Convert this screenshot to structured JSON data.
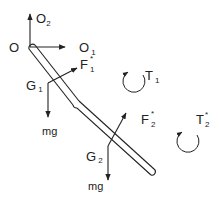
{
  "diagram": {
    "stroke_color": "#222222",
    "origin": {
      "label": "O"
    },
    "axes": [
      {
        "name": "O1",
        "base": "O",
        "sub": "1"
      },
      {
        "name": "O2",
        "base": "O",
        "sub": "2"
      }
    ],
    "links": [
      {
        "name": "link-1",
        "center_of_mass": {
          "base": "G",
          "sub": "1"
        }
      },
      {
        "name": "link-2",
        "center_of_mass": {
          "base": "G",
          "sub": "2"
        }
      }
    ],
    "forces": [
      {
        "name": "F1-star",
        "base": "F",
        "sup": "*",
        "sub": "1"
      },
      {
        "name": "F2-star",
        "base": "F",
        "sup": "*",
        "sub": "2"
      }
    ],
    "weights": [
      {
        "name": "weight-1",
        "label": "mg"
      },
      {
        "name": "weight-2",
        "label": "mg"
      }
    ],
    "torques": [
      {
        "name": "T1",
        "base": "T",
        "sub": "1",
        "sup": ""
      },
      {
        "name": "T2-star",
        "base": "T",
        "sub": "2",
        "sup": "*"
      }
    ]
  }
}
